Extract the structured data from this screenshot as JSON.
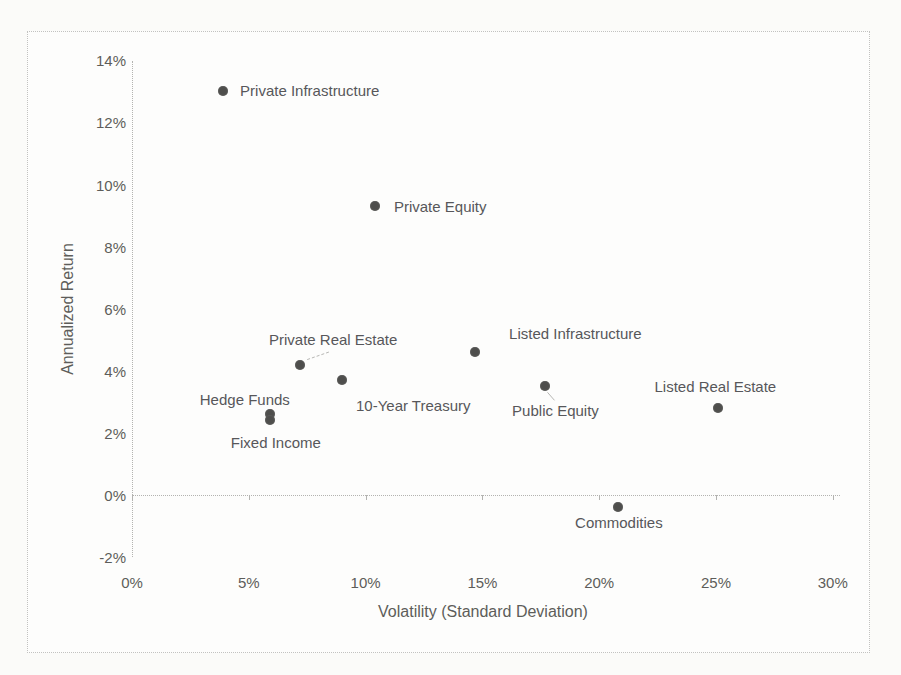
{
  "page": {
    "background": "#fbfbf9",
    "frame_border_color": "#c2c2c0",
    "axis_line_color": "#b3b3b0",
    "marker_color": "#4e4e4c",
    "text_color": "#595959"
  },
  "chart_data": {
    "type": "scatter",
    "title": "",
    "xlabel": "Volatility (Standard Deviation)",
    "ylabel": "Annualized Return",
    "xlim": [
      0,
      30
    ],
    "ylim": [
      -2,
      14
    ],
    "x_ticks": [
      "0%",
      "5%",
      "10%",
      "15%",
      "20%",
      "25%",
      "30%"
    ],
    "y_ticks": [
      "-2%",
      "0%",
      "2%",
      "4%",
      "6%",
      "8%",
      "10%",
      "12%",
      "14%"
    ],
    "grid": "off",
    "legend": "none",
    "x_unit": "percent",
    "y_unit": "percent",
    "points": [
      {
        "label": "Private Infrastructure",
        "x": 3.9,
        "y": 13.0,
        "anchor": "left",
        "dx": 17,
        "dy": -1
      },
      {
        "label": "Private Equity",
        "x": 10.4,
        "y": 9.3,
        "anchor": "left",
        "dx": 19,
        "dy": 0
      },
      {
        "label": "Private Real Estate",
        "x": 7.2,
        "y": 4.2,
        "anchor": "center",
        "dx": 33,
        "dy": -26,
        "leader": {
          "x1": 7,
          "y1": -5,
          "x2": 30,
          "y2": -13,
          "dashed": true
        }
      },
      {
        "label": "10-Year Treasury",
        "x": 9.0,
        "y": 3.7,
        "anchor": "center",
        "dx": 71,
        "dy": 25
      },
      {
        "label": "Hedge Funds",
        "x": 5.9,
        "y": 2.6,
        "anchor": "center",
        "dx": -25,
        "dy": -15
      },
      {
        "label": "Fixed Income",
        "x": 5.9,
        "y": 2.4,
        "anchor": "center",
        "dx": 6,
        "dy": 22
      },
      {
        "label": "Listed Infrastructure",
        "x": 14.7,
        "y": 4.6,
        "anchor": "center",
        "dx": 100,
        "dy": -19
      },
      {
        "label": "Public Equity",
        "x": 17.7,
        "y": 3.5,
        "anchor": "center",
        "dx": 10,
        "dy": 24,
        "leader": {
          "x1": 2,
          "y1": 6,
          "x2": 9,
          "y2": 14,
          "dashed": false
        }
      },
      {
        "label": "Listed Real Estate",
        "x": 25.1,
        "y": 2.8,
        "anchor": "center",
        "dx": -3,
        "dy": -22
      },
      {
        "label": "Commodities",
        "x": 20.8,
        "y": -0.4,
        "anchor": "center",
        "dx": 1,
        "dy": 15
      }
    ]
  }
}
